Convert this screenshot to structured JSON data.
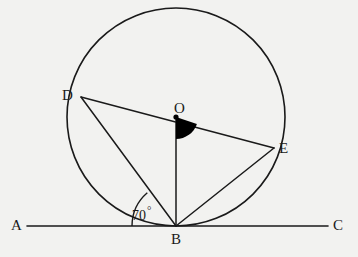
{
  "figure": {
    "background_color": "#f2f2f0",
    "stroke_color": "#1a1a1a",
    "fill_color": "#000000",
    "points": {
      "A": {
        "label": "A",
        "x": 27,
        "y": 226,
        "label_x": 11,
        "label_y": 218
      },
      "B": {
        "label": "B",
        "x": 176,
        "y": 226,
        "label_x": 171,
        "label_y": 232
      },
      "C": {
        "label": "C",
        "x": 328,
        "y": 226,
        "label_x": 333,
        "label_y": 218
      },
      "D": {
        "label": "D",
        "x": 81,
        "y": 97,
        "label_x": 62,
        "label_y": 88
      },
      "E": {
        "label": "E",
        "x": 274,
        "y": 148,
        "label_x": 279,
        "label_y": 141
      },
      "O": {
        "label": "O",
        "x": 176,
        "y": 117,
        "label_x": 174,
        "label_y": 101
      }
    },
    "circle": {
      "cx": 176,
      "cy": 117,
      "r": 109
    },
    "line_ac": {
      "x1": 27,
      "y1": 226,
      "x2": 328,
      "y2": 226
    },
    "segments": [
      {
        "name": "segment-DE",
        "from": "D",
        "to": "E"
      },
      {
        "name": "segment-DB",
        "from": "D",
        "to": "B"
      },
      {
        "name": "segment-OB",
        "from": "O",
        "to": "B"
      },
      {
        "name": "segment-BE",
        "from": "B",
        "to": "E"
      }
    ],
    "angles": {
      "at_b": {
        "label": "70",
        "degree_symbol": "°",
        "value": 70,
        "label_x": 132,
        "label_y": 205,
        "arc_radius": 44,
        "marked_between": "BA and BD"
      },
      "at_o": {
        "label": "",
        "filled": true,
        "sector_radius": 22,
        "marked_between": "OB and OE"
      }
    }
  }
}
